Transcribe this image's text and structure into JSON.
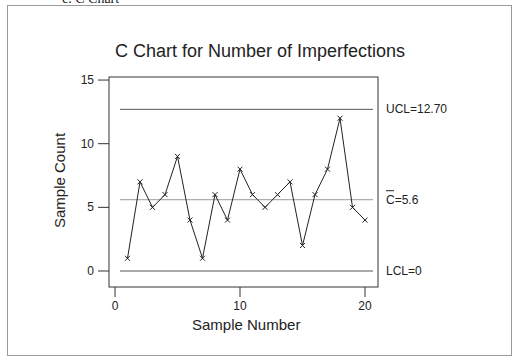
{
  "caption": "c.   C Chart",
  "chart_data": {
    "type": "line",
    "title": "C Chart for Number of Imperfections",
    "xlabel": "Sample Number",
    "ylabel": "Sample Count",
    "x": [
      1,
      2,
      3,
      4,
      5,
      6,
      7,
      8,
      9,
      10,
      11,
      12,
      13,
      14,
      15,
      16,
      17,
      18,
      19,
      20
    ],
    "series": [
      {
        "name": "Sample Count",
        "values": [
          1,
          7,
          5,
          6,
          9,
          4,
          1,
          6,
          4,
          8,
          6,
          5,
          6,
          7,
          2,
          6,
          8,
          12,
          5,
          4
        ],
        "marker": "x"
      }
    ],
    "xlim": [
      0,
      21
    ],
    "ylim": [
      -1.2,
      15.2
    ],
    "xticks": [
      0,
      10,
      20
    ],
    "yticks": [
      0,
      5,
      10,
      15
    ],
    "reference_lines": [
      {
        "name": "UCL",
        "value": 12.7,
        "label": "UCL=12.70"
      },
      {
        "name": "C-bar",
        "value": 5.6,
        "label": "C=5.6",
        "overbar": true
      },
      {
        "name": "LCL",
        "value": 0,
        "label": "LCL=0"
      }
    ],
    "grid": false,
    "legend": "none"
  }
}
